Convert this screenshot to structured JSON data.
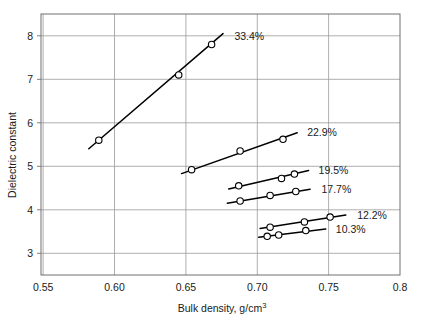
{
  "chart_data": {
    "type": "line",
    "title": "",
    "xlabel": "Bulk density, g/cm3",
    "xlabel_main": "Bulk density, g/cm",
    "xlabel_sup": "3",
    "ylabel": "Dielectric constant",
    "xlim": [
      0.5485,
      0.8
    ],
    "ylim": [
      2.5,
      8.5
    ],
    "xticks": [
      "0.55",
      "0.60",
      "0.65",
      "0.70",
      "0.75",
      "0.8"
    ],
    "xtick_values": [
      0.55,
      0.6,
      0.65,
      0.7,
      0.75,
      0.8
    ],
    "yticks": [
      "3",
      "4",
      "5",
      "6",
      "7",
      "8"
    ],
    "ytick_values": [
      3,
      4,
      5,
      6,
      7,
      8
    ],
    "grid": true,
    "legend_position": "inline-end-of-line",
    "marker": "open-circle",
    "series": [
      {
        "name": "33.4%",
        "label": "33.4%",
        "points": [
          {
            "x": 0.589,
            "y": 5.6
          },
          {
            "x": 0.645,
            "y": 7.1
          },
          {
            "x": 0.668,
            "y": 7.8
          }
        ],
        "fit_start": {
          "x": 0.582,
          "y": 5.4
        },
        "fit_end": {
          "x": 0.676,
          "y": 8.05
        },
        "label_at": {
          "x": 0.684,
          "y": 8.0
        }
      },
      {
        "name": "22.9%",
        "label": "22.9%",
        "points": [
          {
            "x": 0.654,
            "y": 4.92
          },
          {
            "x": 0.688,
            "y": 5.35
          },
          {
            "x": 0.718,
            "y": 5.62
          }
        ],
        "fit_start": {
          "x": 0.647,
          "y": 4.83
        },
        "fit_end": {
          "x": 0.728,
          "y": 5.77
        },
        "label_at": {
          "x": 0.735,
          "y": 5.79
        }
      },
      {
        "name": "19.5%",
        "label": "19.5%",
        "points": [
          {
            "x": 0.687,
            "y": 4.55
          },
          {
            "x": 0.717,
            "y": 4.72
          },
          {
            "x": 0.726,
            "y": 4.82
          }
        ],
        "fit_start": {
          "x": 0.68,
          "y": 4.48
        },
        "fit_end": {
          "x": 0.736,
          "y": 4.9
        },
        "label_at": {
          "x": 0.743,
          "y": 4.92
        }
      },
      {
        "name": "17.7%",
        "label": "17.7%",
        "points": [
          {
            "x": 0.688,
            "y": 4.2
          },
          {
            "x": 0.709,
            "y": 4.33
          },
          {
            "x": 0.727,
            "y": 4.42
          }
        ],
        "fit_start": {
          "x": 0.679,
          "y": 4.15
        },
        "fit_end": {
          "x": 0.737,
          "y": 4.47
        },
        "label_at": {
          "x": 0.745,
          "y": 4.48
        }
      },
      {
        "name": "12.2%",
        "label": "12.2%",
        "points": [
          {
            "x": 0.709,
            "y": 3.6
          },
          {
            "x": 0.733,
            "y": 3.72
          },
          {
            "x": 0.751,
            "y": 3.83
          }
        ],
        "fit_start": {
          "x": 0.702,
          "y": 3.57
        },
        "fit_end": {
          "x": 0.762,
          "y": 3.88
        },
        "label_at": {
          "x": 0.77,
          "y": 3.88
        }
      },
      {
        "name": "10.3%",
        "label": "10.3%",
        "points": [
          {
            "x": 0.707,
            "y": 3.39
          },
          {
            "x": 0.715,
            "y": 3.42
          },
          {
            "x": 0.734,
            "y": 3.52
          }
        ],
        "fit_start": {
          "x": 0.701,
          "y": 3.37
        },
        "fit_end": {
          "x": 0.748,
          "y": 3.56
        },
        "label_at": {
          "x": 0.755,
          "y": 3.55
        }
      }
    ],
    "colors": {
      "line": "#000000",
      "marker_fill": "#ffffff",
      "marker_stroke": "#000000",
      "grid": "#9a9a9a",
      "axis": "#707070",
      "text": "#1a1a1a",
      "background": "#ffffff"
    }
  }
}
